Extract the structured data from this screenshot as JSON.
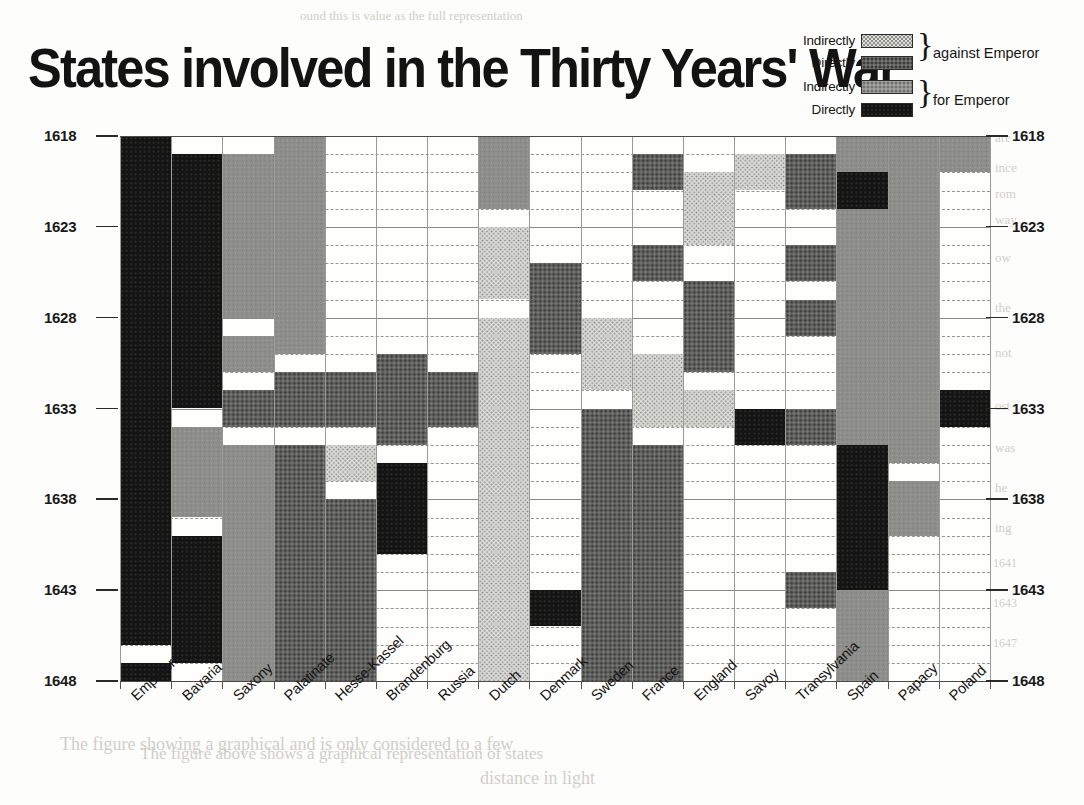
{
  "title": "States involved in the Thirty Years' War",
  "legend": {
    "rows": [
      {
        "label": "Indirectly",
        "key": "ia"
      },
      {
        "label": "Directly",
        "key": "da"
      },
      {
        "label": "Indirectly",
        "key": "if"
      },
      {
        "label": "Directly",
        "key": "df"
      }
    ],
    "group_against": "against Emperor",
    "group_for": "for Emperor"
  },
  "colors": {
    "indirectly_against": "#dcdcd8",
    "directly_against": "#5f5f5d",
    "indirectly_for": "#8e8e8b",
    "directly_for": "#141414",
    "grid": "#6e6e6a",
    "axis": "#4a4a47",
    "background": "#fefefc"
  },
  "chart_data": {
    "type": "heatmap",
    "title": "States involved in the Thirty Years' War",
    "xlabel": "",
    "ylabel": "",
    "grid": true,
    "legend_position": "top-right",
    "ylim": [
      1618,
      1648
    ],
    "y_tick_labels": [
      "1618",
      "1623",
      "1628",
      "1633",
      "1638",
      "1643",
      "1648"
    ],
    "y_ticks": [
      1618,
      1623,
      1628,
      1633,
      1638,
      1643,
      1648
    ],
    "y_minor_step": 1,
    "categories": [
      "Emperor",
      "Bavaria",
      "Saxony",
      "Palatinate",
      "Hesse-Kassel",
      "Brandenburg",
      "Russia",
      "Dutch",
      "Denmark",
      "Sweden",
      "France",
      "England",
      "Savoy",
      "Transylvania",
      "Spain",
      "Papacy",
      "Poland"
    ],
    "value_keys": {
      "ia": "Indirectly against Emperor",
      "da": "Directly against Emperor",
      "if": "Indirectly for Emperor",
      "df": "Directly for Emperor"
    },
    "series": [
      {
        "name": "Emperor",
        "spans": [
          {
            "from": 1618,
            "to": 1646,
            "key": "df"
          },
          {
            "from": 1647,
            "to": 1648,
            "key": "df"
          }
        ]
      },
      {
        "name": "Bavaria",
        "spans": [
          {
            "from": 1619,
            "to": 1633,
            "key": "df"
          },
          {
            "from": 1634,
            "to": 1639,
            "key": "if"
          },
          {
            "from": 1640,
            "to": 1647,
            "key": "df"
          }
        ]
      },
      {
        "name": "Saxony",
        "spans": [
          {
            "from": 1619,
            "to": 1628,
            "key": "if"
          },
          {
            "from": 1629,
            "to": 1631,
            "key": "if"
          },
          {
            "from": 1632,
            "to": 1634,
            "key": "da"
          },
          {
            "from": 1635,
            "to": 1648,
            "key": "if"
          }
        ]
      },
      {
        "name": "Palatinate",
        "spans": [
          {
            "from": 1618,
            "to": 1630,
            "key": "if"
          },
          {
            "from": 1631,
            "to": 1634,
            "key": "da"
          },
          {
            "from": 1635,
            "to": 1648,
            "key": "da"
          }
        ]
      },
      {
        "name": "Hesse-Kassel",
        "spans": [
          {
            "from": 1631,
            "to": 1634,
            "key": "da"
          },
          {
            "from": 1635,
            "to": 1637,
            "key": "ia"
          },
          {
            "from": 1638,
            "to": 1648,
            "key": "da"
          }
        ]
      },
      {
        "name": "Brandenburg",
        "spans": [
          {
            "from": 1630,
            "to": 1635,
            "key": "da"
          },
          {
            "from": 1636,
            "to": 1641,
            "key": "df"
          }
        ]
      },
      {
        "name": "Russia",
        "spans": [
          {
            "from": 1631,
            "to": 1634,
            "key": "da"
          }
        ]
      },
      {
        "name": "Dutch",
        "spans": [
          {
            "from": 1618,
            "to": 1622,
            "key": "if"
          },
          {
            "from": 1623,
            "to": 1627,
            "key": "ia"
          },
          {
            "from": 1628,
            "to": 1648,
            "key": "ia"
          }
        ]
      },
      {
        "name": "Denmark",
        "spans": [
          {
            "from": 1625,
            "to": 1630,
            "key": "da"
          },
          {
            "from": 1643,
            "to": 1645,
            "key": "df"
          }
        ]
      },
      {
        "name": "Sweden",
        "spans": [
          {
            "from": 1628,
            "to": 1632,
            "key": "ia"
          },
          {
            "from": 1633,
            "to": 1648,
            "key": "da"
          }
        ]
      },
      {
        "name": "France",
        "spans": [
          {
            "from": 1619,
            "to": 1621,
            "key": "da"
          },
          {
            "from": 1624,
            "to": 1626,
            "key": "da"
          },
          {
            "from": 1630,
            "to": 1634,
            "key": "ia"
          },
          {
            "from": 1635,
            "to": 1648,
            "key": "da"
          }
        ]
      },
      {
        "name": "England",
        "spans": [
          {
            "from": 1620,
            "to": 1624,
            "key": "ia"
          },
          {
            "from": 1626,
            "to": 1631,
            "key": "da"
          },
          {
            "from": 1632,
            "to": 1634,
            "key": "ia"
          }
        ]
      },
      {
        "name": "Savoy",
        "spans": [
          {
            "from": 1619,
            "to": 1621,
            "key": "ia"
          },
          {
            "from": 1633,
            "to": 1635,
            "key": "df"
          }
        ]
      },
      {
        "name": "Transylvania",
        "spans": [
          {
            "from": 1619,
            "to": 1622,
            "key": "da"
          },
          {
            "from": 1624,
            "to": 1626,
            "key": "da"
          },
          {
            "from": 1627,
            "to": 1629,
            "key": "da"
          },
          {
            "from": 1633,
            "to": 1635,
            "key": "da"
          },
          {
            "from": 1642,
            "to": 1644,
            "key": "da"
          }
        ]
      },
      {
        "name": "Spain",
        "spans": [
          {
            "from": 1618,
            "to": 1648,
            "key": "if"
          },
          {
            "from": 1620,
            "to": 1622,
            "key": "df"
          },
          {
            "from": 1635,
            "to": 1643,
            "key": "df"
          }
        ]
      },
      {
        "name": "Papacy",
        "spans": [
          {
            "from": 1618,
            "to": 1636,
            "key": "if"
          },
          {
            "from": 1637,
            "to": 1640,
            "key": "if"
          }
        ]
      },
      {
        "name": "Poland",
        "spans": [
          {
            "from": 1618,
            "to": 1620,
            "key": "if"
          },
          {
            "from": 1632,
            "to": 1634,
            "key": "df"
          }
        ]
      }
    ]
  },
  "bleed_text": [
    {
      "text": "ound this is value as the full representation",
      "x": 300,
      "y": 8,
      "size": 13
    },
    {
      "text": "are",
      "x": 995,
      "y": 130,
      "size": 13
    },
    {
      "text": "ince",
      "x": 995,
      "y": 160,
      "size": 13
    },
    {
      "text": "rom",
      "x": 995,
      "y": 186,
      "size": 13
    },
    {
      "text": "way",
      "x": 995,
      "y": 212,
      "size": 13
    },
    {
      "text": "ow",
      "x": 995,
      "y": 250,
      "size": 13
    },
    {
      "text": "the",
      "x": 995,
      "y": 300,
      "size": 13
    },
    {
      "text": "not",
      "x": 995,
      "y": 345,
      "size": 13
    },
    {
      "text": "ost",
      "x": 995,
      "y": 398,
      "size": 13
    },
    {
      "text": "was",
      "x": 995,
      "y": 440,
      "size": 13
    },
    {
      "text": "he",
      "x": 995,
      "y": 480,
      "size": 13
    },
    {
      "text": "ing",
      "x": 995,
      "y": 520,
      "size": 13
    },
    {
      "text": "1641",
      "x": 993,
      "y": 556,
      "size": 12
    },
    {
      "text": "1643",
      "x": 993,
      "y": 596,
      "size": 12
    },
    {
      "text": "1647",
      "x": 993,
      "y": 636,
      "size": 12
    },
    {
      "text": "The figure showing a graphical and is only considered to a few",
      "x": 60,
      "y": 734,
      "size": 18
    },
    {
      "text": "distance in light",
      "x": 480,
      "y": 768,
      "size": 18
    },
    {
      "text": "The figure above shows a graphical representation of states",
      "x": 140,
      "y": 744,
      "size": 17
    }
  ]
}
